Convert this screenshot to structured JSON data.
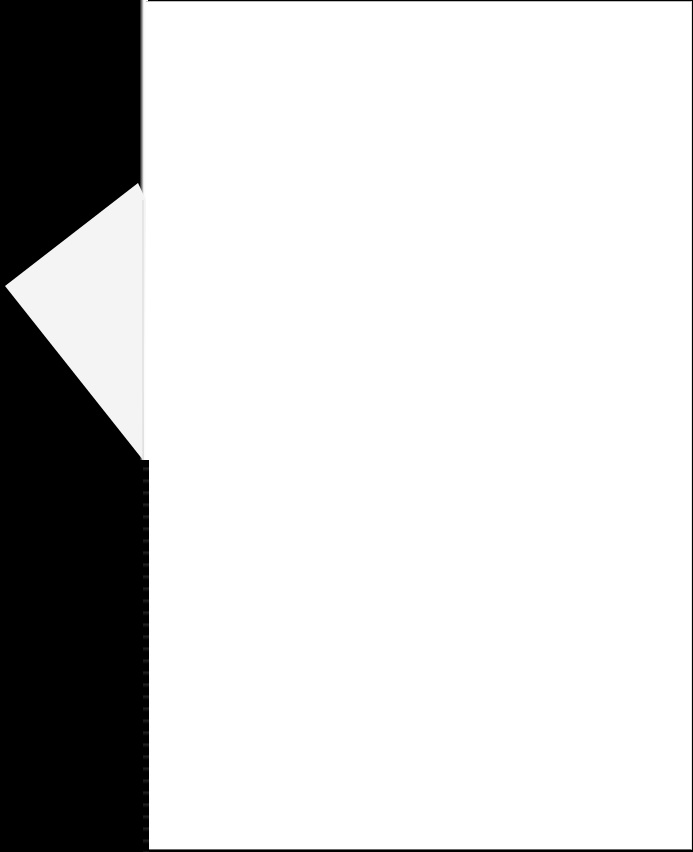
{
  "document": {
    "type": "scanned-page",
    "content": "",
    "colors": {
      "background": "#000000",
      "paper": "#ffffff",
      "fold": "#f4f4f4"
    }
  }
}
